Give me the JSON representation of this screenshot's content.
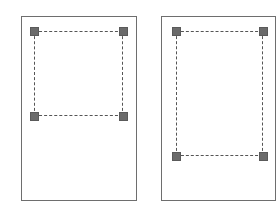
{
  "diagram": {
    "panels": [
      {
        "name": "before",
        "page": {
          "x": 21,
          "y": 16,
          "w": 116,
          "h": 185
        },
        "selection": {
          "x": 34,
          "y": 31,
          "w": 89,
          "h": 85
        },
        "handles": [
          "top-left",
          "top-right",
          "bottom-left",
          "bottom-right"
        ]
      },
      {
        "name": "after",
        "page": {
          "x": 161,
          "y": 16,
          "w": 115,
          "h": 185
        },
        "selection": {
          "x": 176,
          "y": 31,
          "w": 87,
          "h": 125
        },
        "handles": [
          "top-left",
          "top-right",
          "bottom-left",
          "bottom-right"
        ]
      }
    ],
    "colors": {
      "border": "#6e6e6e",
      "handle": "#6b6b6b",
      "dash": "#555555"
    }
  }
}
